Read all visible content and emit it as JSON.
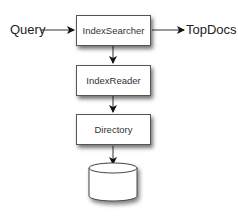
{
  "diagram": {
    "inputs": [
      {
        "label": "Query"
      }
    ],
    "outputs": [
      {
        "label": "TopDocs"
      }
    ],
    "nodes": [
      {
        "id": "index-searcher",
        "label": "IndexSearcher"
      },
      {
        "id": "index-reader",
        "label": "IndexReader"
      },
      {
        "id": "directory",
        "label": "Directory"
      },
      {
        "id": "storage",
        "label": "",
        "shape": "cylinder"
      }
    ],
    "edges": [
      {
        "from": "Query",
        "to": "IndexSearcher"
      },
      {
        "from": "IndexSearcher",
        "to": "TopDocs"
      },
      {
        "from": "IndexSearcher",
        "to": "IndexReader"
      },
      {
        "from": "IndexReader",
        "to": "Directory"
      },
      {
        "from": "Directory",
        "to": "storage"
      }
    ]
  }
}
